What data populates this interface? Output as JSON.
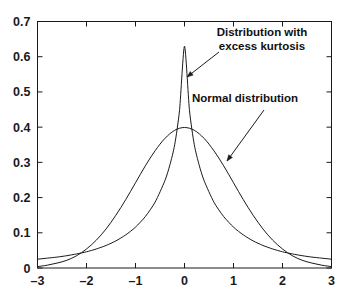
{
  "chart_data": {
    "type": "line",
    "title": "",
    "xlabel": "",
    "ylabel": "",
    "xlim": [
      -3,
      3
    ],
    "ylim": [
      0,
      0.7
    ],
    "grid": false,
    "legend_position": "none",
    "x_ticks": [
      "-3",
      "-2",
      "-1",
      "0",
      "1",
      "2",
      "3"
    ],
    "x_tick_values": [
      -3,
      -2,
      -1,
      0,
      1,
      2,
      3
    ],
    "y_ticks": [
      "0",
      "0.1",
      "0.2",
      "0.3",
      "0.4",
      "0.5",
      "0.6",
      "0.7"
    ],
    "y_tick_values": [
      0,
      0.1,
      0.2,
      0.3,
      0.4,
      0.5,
      0.6,
      0.7
    ],
    "series": [
      {
        "name": "Normal distribution",
        "x": [
          -3,
          -2.8,
          -2.6,
          -2.4,
          -2.2,
          -2,
          -1.8,
          -1.6,
          -1.4,
          -1.2,
          -1,
          -0.8,
          -0.6,
          -0.4,
          -0.2,
          0,
          0.2,
          0.4,
          0.6,
          0.8,
          1,
          1.2,
          1.4,
          1.6,
          1.8,
          2,
          2.2,
          2.4,
          2.6,
          2.8,
          3
        ],
        "values": [
          0.004,
          0.008,
          0.014,
          0.022,
          0.035,
          0.054,
          0.079,
          0.111,
          0.15,
          0.194,
          0.242,
          0.29,
          0.333,
          0.368,
          0.391,
          0.399,
          0.391,
          0.368,
          0.333,
          0.29,
          0.242,
          0.194,
          0.15,
          0.111,
          0.079,
          0.054,
          0.035,
          0.022,
          0.014,
          0.008,
          0.004
        ]
      },
      {
        "name": "Distribution with excess kurtosis",
        "x": [
          -3,
          -2.8,
          -2.6,
          -2.4,
          -2.2,
          -2,
          -1.8,
          -1.6,
          -1.4,
          -1.2,
          -1,
          -0.8,
          -0.6,
          -0.4,
          -0.3,
          -0.2,
          -0.1,
          0,
          0.1,
          0.2,
          0.3,
          0.4,
          0.6,
          0.8,
          1,
          1.2,
          1.4,
          1.6,
          1.8,
          2,
          2.2,
          2.4,
          2.6,
          2.8,
          3
        ],
        "values": [
          0.025,
          0.028,
          0.031,
          0.035,
          0.04,
          0.046,
          0.054,
          0.064,
          0.077,
          0.094,
          0.116,
          0.146,
          0.187,
          0.248,
          0.292,
          0.35,
          0.45,
          0.63,
          0.45,
          0.35,
          0.292,
          0.248,
          0.187,
          0.146,
          0.116,
          0.094,
          0.077,
          0.064,
          0.054,
          0.046,
          0.04,
          0.035,
          0.031,
          0.028,
          0.025
        ]
      }
    ],
    "annotations": [
      {
        "name": "kurtosis-annotation",
        "lines": [
          "Distribution with",
          "excess kurtosis"
        ],
        "text_x": 262,
        "text_y": 36,
        "leader_from_x": 219,
        "leader_from_y": 52,
        "leader_to_x": 187,
        "leader_to_y": 77
      },
      {
        "name": "normal-annotation",
        "lines": [
          "Normal distribution"
        ],
        "text_x": 245,
        "text_y": 102,
        "leader_from_x": 264,
        "leader_from_y": 110,
        "leader_to_x": 227,
        "leader_to_y": 161
      }
    ],
    "colors": {
      "curve": "#1a1a1a",
      "axis": "#1a1a1a",
      "background": "#ffffff",
      "text": "#111111"
    }
  }
}
